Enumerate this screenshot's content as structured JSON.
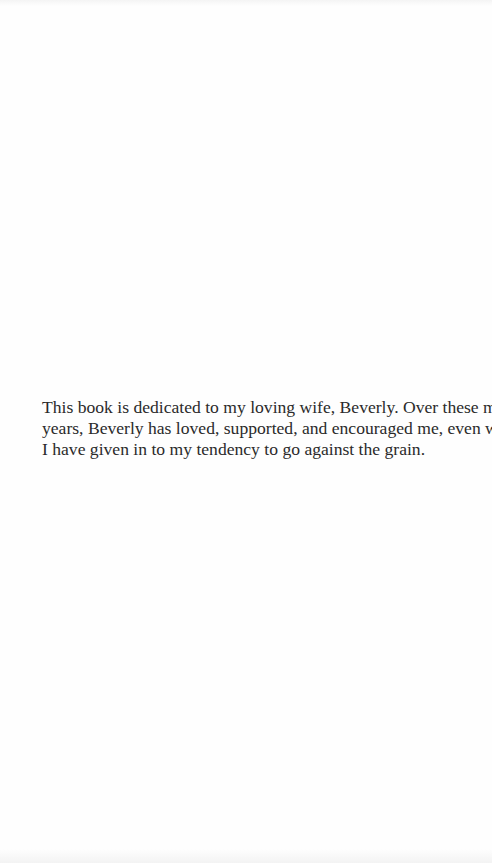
{
  "page": {
    "type": "dedication",
    "background": "#fefefe",
    "text_color": "#2a2a2a"
  },
  "dedication": {
    "lines": [
      "This book is dedicated to my loving wife, Beverly. Over these many",
      "years, Beverly has loved, supported, and encouraged me, even when",
      "I have given in to my tendency to go against the grain."
    ]
  }
}
